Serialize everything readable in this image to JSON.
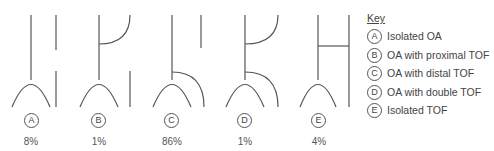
{
  "diagrams": [
    {
      "letter": "A",
      "percent": "8%"
    },
    {
      "letter": "B",
      "percent": "1%"
    },
    {
      "letter": "C",
      "percent": "86%"
    },
    {
      "letter": "D",
      "percent": "1%"
    },
    {
      "letter": "E",
      "percent": "4%"
    }
  ],
  "key": {
    "title": "Key",
    "items": [
      {
        "letter": "A",
        "label": "Isolated OA"
      },
      {
        "letter": "B",
        "label": "OA with proximal TOF"
      },
      {
        "letter": "C",
        "label": "OA with distal TOF"
      },
      {
        "letter": "D",
        "label": "OA with double TOF"
      },
      {
        "letter": "E",
        "label": "Isolated TOF"
      }
    ]
  },
  "colors": {
    "line": "#555555",
    "text": "#444444"
  }
}
